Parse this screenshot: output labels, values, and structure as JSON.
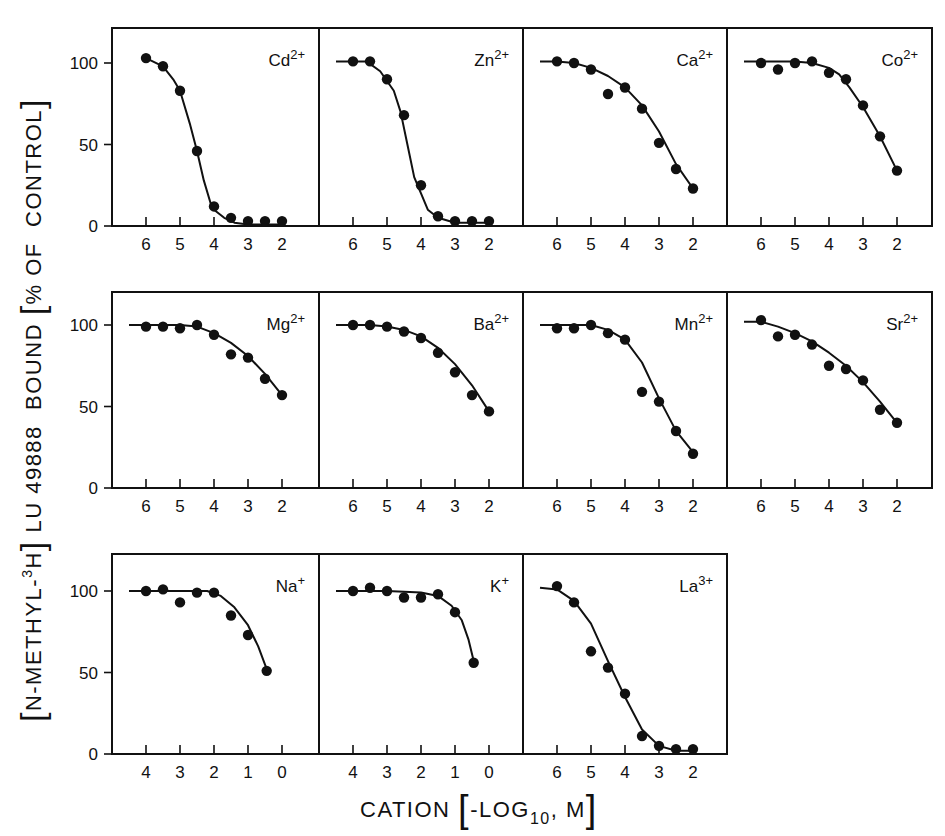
{
  "figure": {
    "y_axis_label": {
      "prefix_bracket_open": "[",
      "compound_part1": "N-METHYL-",
      "isotope_sup": "3",
      "isotope": "H",
      "prefix_bracket_close": "]",
      "middle": " LU 49888  BOUND ",
      "unit_bracket_open": "[",
      "unit": "% OF  CONTROL",
      "unit_bracket_close": "]"
    },
    "x_axis_label": {
      "text": "CATION ",
      "bracket_open": "[",
      "log_text": "-LOG",
      "log_sub": "10",
      "unit": ", M",
      "bracket_close": "]"
    },
    "colors": {
      "ink": "#111111",
      "background": "#ffffff"
    }
  },
  "chart_data": [
    {
      "type": "line",
      "title": "Cd2+",
      "ion": "Cd",
      "charge": "2+",
      "row": 0,
      "col": 0,
      "xticks": [
        6,
        5,
        4,
        3,
        2
      ],
      "xlim": [
        7,
        0.95
      ],
      "yticks": [
        0,
        50,
        100
      ],
      "ylim": [
        0,
        121
      ],
      "xlabel": "CATION [-LOG10, M]",
      "ylabel": "[N-METHYL-3H] LU 49888 BOUND [% OF CONTROL]",
      "x": [
        6,
        5.5,
        5,
        4.5,
        4,
        3.5,
        3,
        2.5,
        2
      ],
      "y": [
        103,
        98,
        83,
        46,
        12,
        5,
        3,
        3,
        3
      ],
      "curve": [
        [
          6,
          103
        ],
        [
          5.5,
          98
        ],
        [
          5.2,
          90
        ],
        [
          5,
          83
        ],
        [
          4.7,
          62
        ],
        [
          4.5,
          46
        ],
        [
          4.3,
          28
        ],
        [
          4.1,
          14
        ],
        [
          4,
          10
        ],
        [
          3.7,
          5
        ],
        [
          3.4,
          2
        ],
        [
          3,
          1
        ],
        [
          2.5,
          1
        ],
        [
          2,
          1
        ]
      ]
    },
    {
      "type": "line",
      "title": "Zn2+",
      "ion": "Zn",
      "charge": "2+",
      "row": 0,
      "col": 1,
      "xticks": [
        6,
        5,
        4,
        3,
        2
      ],
      "xlim": [
        7,
        0.95
      ],
      "yticks": [
        0,
        50,
        100
      ],
      "ylim": [
        0,
        121
      ],
      "x": [
        6,
        5.5,
        5,
        4.5,
        4,
        3.5,
        3,
        2.5,
        2
      ],
      "y": [
        101,
        101,
        90,
        68,
        25,
        6,
        3,
        3,
        3
      ],
      "curve": [
        [
          6.5,
          101
        ],
        [
          5.6,
          101
        ],
        [
          5.2,
          95
        ],
        [
          4.8,
          83
        ],
        [
          4.6,
          70
        ],
        [
          4.4,
          50
        ],
        [
          4.2,
          30
        ],
        [
          4,
          20
        ],
        [
          3.8,
          10
        ],
        [
          3.5,
          5
        ],
        [
          3,
          2
        ],
        [
          2,
          2
        ]
      ]
    },
    {
      "type": "line",
      "title": "Ca2+",
      "ion": "Ca",
      "charge": "2+",
      "row": 0,
      "col": 2,
      "xticks": [
        6,
        5,
        4,
        3,
        2
      ],
      "xlim": [
        7,
        0.95
      ],
      "yticks": [
        0,
        50,
        100
      ],
      "ylim": [
        0,
        121
      ],
      "x": [
        6,
        5.5,
        5,
        4.5,
        4,
        3.5,
        3,
        2.5,
        2
      ],
      "y": [
        101,
        100,
        96,
        81,
        85,
        72,
        51,
        35,
        23
      ],
      "curve": [
        [
          6.5,
          101
        ],
        [
          6,
          101
        ],
        [
          5.5,
          100
        ],
        [
          5,
          97
        ],
        [
          4.5,
          92
        ],
        [
          4,
          85
        ],
        [
          3.5,
          74
        ],
        [
          3,
          58
        ],
        [
          2.5,
          38
        ],
        [
          2,
          23
        ]
      ]
    },
    {
      "type": "line",
      "title": "Co2+",
      "ion": "Co",
      "charge": "2+",
      "row": 0,
      "col": 3,
      "xticks": [
        6,
        5,
        4,
        3,
        2
      ],
      "xlim": [
        7,
        0.95
      ],
      "yticks": [
        0,
        50,
        100
      ],
      "ylim": [
        0,
        121
      ],
      "x": [
        6,
        5.5,
        5,
        4.5,
        4,
        3.5,
        3,
        2.5,
        2
      ],
      "y": [
        100,
        96,
        100,
        101,
        94,
        90,
        74,
        55,
        34
      ],
      "curve": [
        [
          6.5,
          101
        ],
        [
          5,
          101
        ],
        [
          4.5,
          100
        ],
        [
          4,
          97
        ],
        [
          3.7,
          93
        ],
        [
          3.4,
          85
        ],
        [
          3,
          73
        ],
        [
          2.5,
          55
        ],
        [
          2,
          34
        ]
      ]
    },
    {
      "type": "line",
      "title": "Mg2+",
      "ion": "Mg",
      "charge": "2+",
      "row": 1,
      "col": 0,
      "xticks": [
        6,
        5,
        4,
        3,
        2
      ],
      "xlim": [
        7,
        0.95
      ],
      "yticks": [
        0,
        50,
        100
      ],
      "ylim": [
        0,
        121
      ],
      "x": [
        6,
        5.5,
        5,
        4.5,
        4,
        3.5,
        3,
        2.5,
        2
      ],
      "y": [
        99,
        99,
        98,
        100,
        94,
        82,
        80,
        67,
        57
      ],
      "curve": [
        [
          6.5,
          100
        ],
        [
          5,
          100
        ],
        [
          4.5,
          99
        ],
        [
          4,
          95
        ],
        [
          3.5,
          89
        ],
        [
          3,
          81
        ],
        [
          2.5,
          70
        ],
        [
          2,
          57
        ]
      ]
    },
    {
      "type": "line",
      "title": "Ba2+",
      "ion": "Ba",
      "charge": "2+",
      "row": 1,
      "col": 1,
      "xticks": [
        6,
        5,
        4,
        3,
        2
      ],
      "xlim": [
        7,
        0.95
      ],
      "yticks": [
        0,
        50,
        100
      ],
      "ylim": [
        0,
        121
      ],
      "x": [
        6,
        5.5,
        5,
        4.5,
        4,
        3.5,
        3,
        2.5,
        2
      ],
      "y": [
        100,
        100,
        99,
        96,
        92,
        83,
        71,
        57,
        47
      ],
      "curve": [
        [
          6.5,
          100
        ],
        [
          5.5,
          100
        ],
        [
          5,
          99
        ],
        [
          4.5,
          97
        ],
        [
          4,
          93
        ],
        [
          3.5,
          86
        ],
        [
          3,
          76
        ],
        [
          2.5,
          63
        ],
        [
          2,
          47
        ]
      ]
    },
    {
      "type": "line",
      "title": "Mn2+",
      "ion": "Mn",
      "charge": "2+",
      "row": 1,
      "col": 2,
      "xticks": [
        6,
        5,
        4,
        3,
        2
      ],
      "xlim": [
        7,
        0.95
      ],
      "yticks": [
        0,
        50,
        100
      ],
      "ylim": [
        0,
        121
      ],
      "x": [
        6,
        5.5,
        5,
        4.5,
        4,
        3.5,
        3,
        2.5,
        2
      ],
      "y": [
        98,
        98,
        100,
        95,
        91,
        59,
        53,
        35,
        21
      ],
      "curve": [
        [
          6.5,
          100
        ],
        [
          5,
          100
        ],
        [
          4.5,
          97
        ],
        [
          4,
          91
        ],
        [
          3.5,
          77
        ],
        [
          3,
          55
        ],
        [
          2.5,
          35
        ],
        [
          2,
          22
        ]
      ]
    },
    {
      "type": "line",
      "title": "Sr2+",
      "ion": "Sr",
      "charge": "2+",
      "row": 1,
      "col": 3,
      "xticks": [
        6,
        5,
        4,
        3,
        2
      ],
      "xlim": [
        7,
        0.95
      ],
      "yticks": [
        0,
        50,
        100
      ],
      "ylim": [
        0,
        121
      ],
      "x": [
        6,
        5.5,
        5,
        4.5,
        4,
        3.5,
        3,
        2.5,
        2
      ],
      "y": [
        103,
        93,
        94,
        88,
        75,
        73,
        66,
        48,
        40
      ],
      "curve": [
        [
          6.5,
          102
        ],
        [
          6,
          102
        ],
        [
          5.5,
          99
        ],
        [
          5,
          95
        ],
        [
          4.5,
          90
        ],
        [
          4,
          83
        ],
        [
          3.5,
          75
        ],
        [
          3,
          65
        ],
        [
          2.5,
          53
        ],
        [
          2,
          40
        ]
      ]
    },
    {
      "type": "line",
      "title": "Na+",
      "ion": "Na",
      "charge": "+",
      "row": 2,
      "col": 0,
      "xticks": [
        4,
        3,
        2,
        1,
        0
      ],
      "xlim": [
        5,
        -1.05
      ],
      "yticks": [
        0,
        50,
        100
      ],
      "ylim": [
        0,
        121
      ],
      "x": [
        4,
        3.5,
        3,
        2.5,
        2,
        1.5,
        1,
        0.45
      ],
      "y": [
        100,
        101,
        93,
        99,
        99,
        85,
        73,
        51
      ],
      "curve": [
        [
          4.5,
          100
        ],
        [
          3,
          100
        ],
        [
          2.2,
          100
        ],
        [
          1.8,
          97
        ],
        [
          1.4,
          90
        ],
        [
          1,
          79
        ],
        [
          0.7,
          66
        ],
        [
          0.45,
          52
        ]
      ]
    },
    {
      "type": "line",
      "title": "K+",
      "ion": "K",
      "charge": "+",
      "row": 2,
      "col": 1,
      "xticks": [
        4,
        3,
        2,
        1,
        0
      ],
      "xlim": [
        5,
        -1.05
      ],
      "yticks": [
        0,
        50,
        100
      ],
      "ylim": [
        0,
        121
      ],
      "x": [
        4,
        3.5,
        3,
        2.5,
        2,
        1.5,
        1,
        0.45
      ],
      "y": [
        100,
        102,
        100,
        96,
        96,
        98,
        87,
        56
      ],
      "curve": [
        [
          4.5,
          100
        ],
        [
          3,
          100
        ],
        [
          2,
          99
        ],
        [
          1.5,
          97
        ],
        [
          1.1,
          91
        ],
        [
          0.8,
          82
        ],
        [
          0.6,
          70
        ],
        [
          0.45,
          57
        ]
      ]
    },
    {
      "type": "line",
      "title": "La3+",
      "ion": "La",
      "charge": "3+",
      "row": 2,
      "col": 2,
      "xticks": [
        6,
        5,
        4,
        3,
        2
      ],
      "xlim": [
        7,
        0.95
      ],
      "yticks": [
        0,
        50,
        100
      ],
      "ylim": [
        0,
        121
      ],
      "x": [
        6,
        5.5,
        5,
        4.5,
        4,
        3.5,
        3,
        2.5,
        2
      ],
      "y": [
        103,
        93,
        63,
        53,
        37,
        11,
        5,
        3,
        3
      ],
      "curve": [
        [
          6.5,
          102
        ],
        [
          6,
          101
        ],
        [
          5.5,
          94
        ],
        [
          5,
          80
        ],
        [
          4.5,
          57
        ],
        [
          4,
          35
        ],
        [
          3.5,
          15
        ],
        [
          3,
          5
        ],
        [
          2.5,
          2
        ],
        [
          2,
          2
        ]
      ]
    }
  ]
}
